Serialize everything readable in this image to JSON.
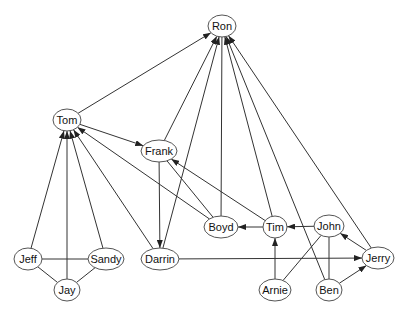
{
  "diagram": {
    "type": "directed-graph",
    "line_color": "#333333",
    "node_fill": "#ffffff",
    "node_stroke": "#555555",
    "nodes": [
      {
        "id": "ron",
        "label": "Ron",
        "x": 222,
        "y": 26,
        "rx": 14,
        "ry": 11
      },
      {
        "id": "tom",
        "label": "Tom",
        "x": 67,
        "y": 120,
        "rx": 14,
        "ry": 11
      },
      {
        "id": "frank",
        "label": "Frank",
        "x": 159,
        "y": 151,
        "rx": 18,
        "ry": 11
      },
      {
        "id": "boyd",
        "label": "Boyd",
        "x": 221,
        "y": 227,
        "rx": 17,
        "ry": 11
      },
      {
        "id": "tim",
        "label": "Tim",
        "x": 275,
        "y": 227,
        "rx": 12,
        "ry": 11
      },
      {
        "id": "john",
        "label": "John",
        "x": 329,
        "y": 226,
        "rx": 15,
        "ry": 11
      },
      {
        "id": "jeff",
        "label": "Jeff",
        "x": 28,
        "y": 259,
        "rx": 14,
        "ry": 11
      },
      {
        "id": "sandy",
        "label": "Sandy",
        "x": 106,
        "y": 259,
        "rx": 18,
        "ry": 11
      },
      {
        "id": "darrin",
        "label": "Darrin",
        "x": 160,
        "y": 259,
        "rx": 19,
        "ry": 11
      },
      {
        "id": "jerry",
        "label": "Jerry",
        "x": 378,
        "y": 258,
        "rx": 16,
        "ry": 11
      },
      {
        "id": "jay",
        "label": "Jay",
        "x": 67,
        "y": 290,
        "rx": 13,
        "ry": 11
      },
      {
        "id": "arnie",
        "label": "Arnie",
        "x": 275,
        "y": 290,
        "rx": 16,
        "ry": 11
      },
      {
        "id": "ben",
        "label": "Ben",
        "x": 329,
        "y": 290,
        "rx": 13,
        "ry": 11
      }
    ],
    "edges": [
      {
        "from": "tom",
        "to": "ron",
        "arrow": true
      },
      {
        "from": "frank",
        "to": "ron",
        "arrow": true
      },
      {
        "from": "darrin",
        "to": "ron",
        "arrow": true
      },
      {
        "from": "boyd",
        "to": "ron",
        "arrow": false
      },
      {
        "from": "tim",
        "to": "ron",
        "arrow": true
      },
      {
        "from": "ben",
        "to": "ron",
        "arrow": true
      },
      {
        "from": "jerry",
        "to": "ron",
        "arrow": true
      },
      {
        "from": "tom",
        "to": "frank",
        "arrow": true
      },
      {
        "from": "frank",
        "to": "darrin",
        "arrow": true
      },
      {
        "from": "jeff",
        "to": "tom",
        "arrow": true
      },
      {
        "from": "jay",
        "to": "tom",
        "arrow": true
      },
      {
        "from": "sandy",
        "to": "tom",
        "arrow": true
      },
      {
        "from": "darrin",
        "to": "tom",
        "arrow": true
      },
      {
        "from": "boyd",
        "to": "tom",
        "arrow": true
      },
      {
        "from": "boyd",
        "to": "frank",
        "arrow": false
      },
      {
        "from": "tim",
        "to": "frank",
        "arrow": true
      },
      {
        "from": "tim",
        "to": "boyd",
        "arrow": true
      },
      {
        "from": "john",
        "to": "tim",
        "arrow": true
      },
      {
        "from": "arnie",
        "to": "tim",
        "arrow": true
      },
      {
        "from": "jerry",
        "to": "john",
        "arrow": true
      },
      {
        "from": "ben",
        "to": "jerry",
        "arrow": true
      },
      {
        "from": "darrin",
        "to": "jerry",
        "arrow": true
      },
      {
        "from": "jeff",
        "to": "sandy",
        "arrow": false
      },
      {
        "from": "jeff",
        "to": "jay",
        "arrow": false
      },
      {
        "from": "jay",
        "to": "sandy",
        "arrow": false
      },
      {
        "from": "john",
        "to": "arnie",
        "arrow": false
      },
      {
        "from": "john",
        "to": "ben",
        "arrow": false
      }
    ]
  }
}
